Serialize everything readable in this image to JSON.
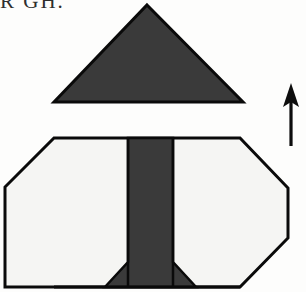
{
  "page": {
    "background_color": "#fdfdfc",
    "width": 306,
    "height": 292
  },
  "caption": {
    "clipped_text": "R GH.",
    "note": "partially cropped serif text at top-left edge"
  },
  "figure": {
    "colors": {
      "dark_fill": "#3a3a3a",
      "light_fill": "#f5f5f3",
      "outline": "#0a0a0a",
      "arrow": "#0d0d0d"
    },
    "shapes": {
      "top_triangle": {
        "name": "flap-triangle",
        "fill": "#3a3a3a",
        "points": "147,5 243,102 54,102"
      },
      "body_octagon": {
        "name": "base-octagon",
        "fill": "#f5f5f3",
        "points": "54,138 240,138 288,188 288,238 240,287 105,287 5,287 5,237 5,187"
      },
      "center_band": {
        "name": "center-fold-band",
        "fill": "#3a3a3a",
        "points": "128,138 173,138 173,262 196,287 105,287 128,262"
      },
      "band_left_x": 128,
      "band_right_x": 173,
      "band_flare_top_y": 262,
      "band_flare_left_x": 105,
      "band_flare_right_x": 196
    },
    "arrow": {
      "name": "direction-arrow",
      "direction": "up",
      "tip_x": 291,
      "tip_y": 83,
      "tail_y": 146,
      "head_half_width": 8,
      "shaft_width": 3
    }
  }
}
